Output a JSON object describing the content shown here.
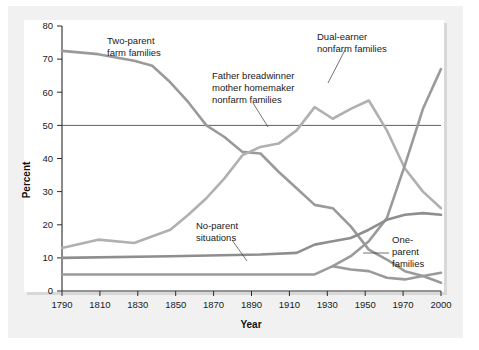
{
  "figure": {
    "background_color": "#f1f1f1",
    "plot_background_color": "#ffffff"
  },
  "chart_data": {
    "type": "line",
    "title": "",
    "xlabel": "Year",
    "ylabel": "Percent",
    "xlim": [
      1790,
      2000
    ],
    "ylim": [
      0,
      80
    ],
    "grid": false,
    "legend_position": "inline-annotations",
    "xticks": [
      1790,
      1810,
      1830,
      1850,
      1870,
      1890,
      1910,
      1930,
      1950,
      1970,
      2000
    ],
    "xtick_labels": [
      "1790",
      "1810",
      "1830",
      "1850",
      "1870",
      "1890",
      "1910",
      "1930",
      "1950",
      "1970",
      "2000"
    ],
    "yticks": [
      0,
      10,
      20,
      30,
      40,
      50,
      60,
      70,
      80
    ],
    "ytick_labels": [
      "0",
      "10",
      "20",
      "30",
      "40",
      "50",
      "60",
      "70",
      "80"
    ],
    "reference_lines": [
      {
        "name": "fifty-percent-line",
        "orientation": "horizontal",
        "value": 50,
        "color": "#4d4d4d"
      }
    ],
    "series": [
      {
        "name": "Two-parent farm families",
        "color": "#9a9a9a",
        "x": [
          1790,
          1810,
          1830,
          1840,
          1850,
          1860,
          1870,
          1880,
          1890,
          1900,
          1910,
          1920,
          1930,
          1940,
          1950,
          1960,
          1970,
          1980,
          1990,
          2000
        ],
        "values": [
          72.5,
          71.5,
          69.5,
          68,
          63,
          57,
          50,
          46.5,
          42,
          41.5,
          36,
          31,
          26,
          25,
          19.5,
          12.5,
          9.5,
          6,
          4.5,
          2.5
        ]
      },
      {
        "name": "Father breadwinner mother homemaker nonfarm families",
        "color": "#b0b0b0",
        "x": [
          1790,
          1810,
          1830,
          1850,
          1860,
          1870,
          1880,
          1890,
          1900,
          1910,
          1920,
          1930,
          1940,
          1950,
          1960,
          1970,
          1980,
          1990,
          2000
        ],
        "values": [
          13,
          15.5,
          14.5,
          18.5,
          23,
          28,
          34,
          41,
          43.5,
          44.5,
          48.5,
          55.5,
          52,
          55,
          57.5,
          48.5,
          37,
          30,
          25
        ]
      },
      {
        "name": "Dual-earner nonfarm families",
        "color": "#9a9a9a",
        "x": [
          1940,
          1950,
          1960,
          1970,
          1980,
          1990,
          2000
        ],
        "values": [
          7.5,
          10.5,
          15,
          22,
          38,
          55,
          67
        ]
      },
      {
        "name": "One-parent families",
        "color": "#8e8e8e",
        "x": [
          1790,
          1850,
          1900,
          1920,
          1930,
          1940,
          1950,
          1960,
          1970,
          1980,
          1990,
          2000
        ],
        "values": [
          10,
          10.5,
          11,
          11.5,
          14,
          15,
          16,
          18.5,
          21.5,
          23,
          23.5,
          23
        ]
      },
      {
        "name": "No-parent situations",
        "color": "#9a9a9a",
        "x": [
          1790,
          1850,
          1900,
          1930,
          1940,
          1950,
          1960,
          1970,
          1980,
          1990,
          2000
        ],
        "values": [
          5,
          5,
          5,
          5,
          7.5,
          6.5,
          6,
          4,
          3.5,
          4.5,
          5.5
        ]
      }
    ],
    "annotations": [
      {
        "name": "annotation-two-parent-farm-families",
        "lines": [
          "Two-parent",
          "farm families"
        ],
        "has_leader": false
      },
      {
        "name": "annotation-father-breadwinner",
        "lines": [
          "Father breadwinner",
          "mother homemaker",
          "nonfarm families"
        ],
        "has_leader": true
      },
      {
        "name": "annotation-dual-earner",
        "lines": [
          "Dual-earner",
          "nonfarm families"
        ],
        "has_leader": true
      },
      {
        "name": "annotation-no-parent-situations",
        "lines": [
          "No-parent",
          "situations"
        ],
        "has_leader": true
      },
      {
        "name": "annotation-one-parent-families",
        "lines": [
          "One-",
          "parent",
          "families"
        ],
        "has_leader": true
      }
    ]
  }
}
